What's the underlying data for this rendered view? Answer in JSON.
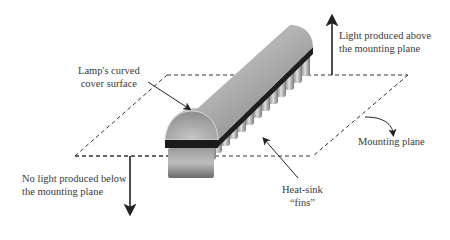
{
  "diagram": {
    "type": "3d-illustration",
    "labels": {
      "cover": {
        "line1": "Lamp's curved",
        "line2": "cover surface"
      },
      "above": {
        "line1": "Light produced above",
        "line2": "the mounting plane"
      },
      "below": {
        "line1": "No light produced below",
        "line2": "the mounting plane"
      },
      "plane": {
        "line1": "Mounting plane"
      },
      "fins": {
        "line1": "Heat-sink",
        "line2": "“fins”"
      }
    },
    "colors": {
      "line": "#333333",
      "lamp_light": "#c8c8c8",
      "lamp_dark": "#6e6e6e",
      "base": "#1e1e1e"
    }
  }
}
